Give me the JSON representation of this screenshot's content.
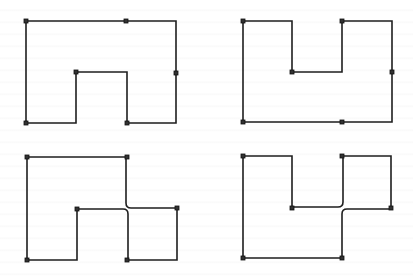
{
  "figure": {
    "width": 413,
    "height": 278,
    "line_color": "#1e1e1e",
    "marker_color": "#222222",
    "marker_size": 4,
    "panels": [
      {
        "id": "top-left",
        "description": "Single polygon with a rectangular notch cut into the bottom",
        "paths": [
          "M26,21 L176,21 L176,123 L127,123 L127,72 L76,72 L76,123 L26,123 Z"
        ],
        "markers": [
          [
            26,
            21
          ],
          [
            126,
            21
          ],
          [
            176,
            73
          ],
          [
            76,
            72
          ],
          [
            26,
            123
          ],
          [
            127,
            123
          ]
        ]
      },
      {
        "id": "top-right",
        "description": "Single polygon with a rectangular notch cut into the top",
        "paths": [
          "M243,21 L292,21 L292,72 L342,72 L342,21 L392,21 L392,122 L243,122 Z"
        ],
        "markers": [
          [
            243,
            21
          ],
          [
            342,
            21
          ],
          [
            292,
            72
          ],
          [
            392,
            72
          ],
          [
            243,
            122
          ],
          [
            342,
            122
          ]
        ]
      },
      {
        "id": "bottom-left",
        "description": "Polygon whose boundary touches itself at a junction with rounded bends",
        "paths": [
          "M27,157 L126,157 L126,203 Q126,208 131,208 L177,208 L177,260 L128,260 L128,214 Q128,209 123,209 L77,209 L77,260 L27,260 Z"
        ],
        "markers": [
          [
            27,
            157
          ],
          [
            127,
            157
          ],
          [
            77,
            209
          ],
          [
            177,
            208
          ],
          [
            27,
            260
          ],
          [
            127,
            260
          ]
        ]
      },
      {
        "id": "bottom-right",
        "description": "Polygon whose boundary touches itself at a junction with rounded bends",
        "paths": [
          "M243,156 L292,156 L292,207 L338,207 Q343,207 343,202 L343,156 L391,156 L391,209 L347,209 Q342,209 342,214 L342,258 L243,258 Z"
        ],
        "markers": [
          [
            243,
            156
          ],
          [
            342,
            156
          ],
          [
            292,
            208
          ],
          [
            391,
            208
          ],
          [
            243,
            258
          ],
          [
            342,
            258
          ]
        ]
      }
    ]
  }
}
